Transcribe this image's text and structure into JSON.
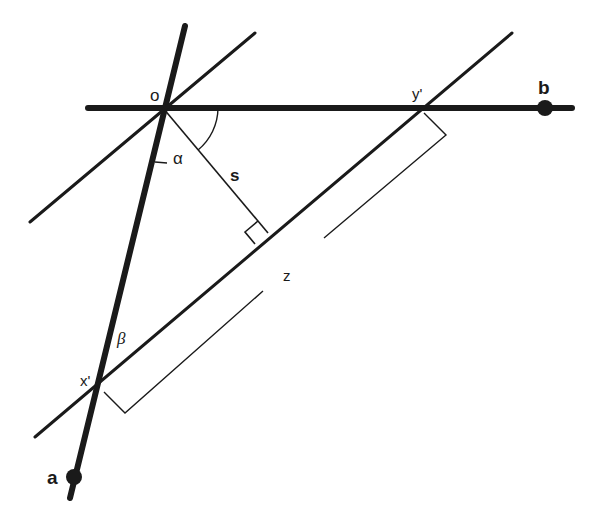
{
  "diagram": {
    "type": "geometry",
    "colors": {
      "stroke": "#1a1a1a",
      "background": "#ffffff"
    },
    "labels": {
      "origin": "o",
      "point_a": "a",
      "point_b": "b",
      "x_prime": "x'",
      "y_prime": "y'",
      "distance": "s",
      "length": "z",
      "alpha": "α",
      "beta": "β"
    },
    "points": {
      "o": [
        163,
        108
      ],
      "a": [
        74,
        477
      ],
      "b": [
        545,
        108
      ],
      "x_prime": [
        97,
        390
      ],
      "y_prime": [
        420,
        108
      ],
      "foot_of_perpendicular": [
        268,
        233
      ]
    },
    "lines": [
      {
        "name": "line-ob",
        "thickness": "thick",
        "from": [
          88,
          108
        ],
        "to": [
          572,
          108
        ]
      },
      {
        "name": "line-oa",
        "thickness": "thick",
        "from": [
          185,
          25
        ],
        "to": [
          70,
          498
        ]
      },
      {
        "name": "parallel-through-o",
        "thickness": "medium",
        "from": [
          255,
          33
        ],
        "to": [
          30,
          222
        ]
      },
      {
        "name": "line-xy",
        "thickness": "medium",
        "from": [
          512,
          33
        ],
        "to": [
          35,
          437
        ]
      },
      {
        "name": "perpendicular-s",
        "thickness": "thin",
        "from": [
          163,
          108
        ],
        "to": [
          268,
          233
        ]
      }
    ]
  }
}
